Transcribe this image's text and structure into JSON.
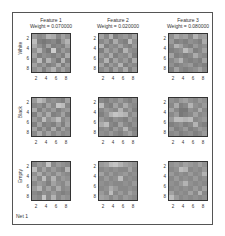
{
  "chart_data": {
    "type": "heatmap",
    "title": "",
    "figure_label": "Net 1",
    "columns": [
      {
        "title": "Feature 1",
        "weight_label": "Weight = 0.070000",
        "weight": 0.07
      },
      {
        "title": "Feature 2",
        "weight_label": "Weight = 0.020000",
        "weight": 0.02
      },
      {
        "title": "Feature 3",
        "weight_label": "Weight = 0.080000",
        "weight": 0.08
      }
    ],
    "rows": [
      "White",
      "Black",
      "Empty"
    ],
    "xticks": [
      "2",
      "4",
      "6",
      "8"
    ],
    "yticks": [
      "2",
      "4",
      "6",
      "8"
    ],
    "grid_size": [
      8,
      8
    ],
    "colormap": "gray",
    "panels": [
      [
        [
          [
            0.55,
            0.45,
            0.5,
            0.7,
            0.65,
            0.45,
            0.6,
            0.5
          ],
          [
            0.75,
            0.4,
            0.35,
            0.4,
            0.45,
            0.35,
            0.55,
            0.7
          ],
          [
            0.65,
            0.5,
            0.4,
            0.6,
            0.4,
            0.45,
            0.4,
            0.6
          ],
          [
            0.5,
            0.7,
            0.45,
            0.35,
            0.85,
            0.4,
            0.55,
            0.45
          ],
          [
            0.6,
            0.4,
            0.5,
            0.45,
            0.4,
            0.5,
            0.4,
            0.65
          ],
          [
            0.45,
            0.75,
            0.4,
            0.7,
            0.5,
            0.35,
            0.7,
            0.4
          ],
          [
            0.6,
            0.45,
            0.55,
            0.4,
            0.45,
            0.65,
            0.4,
            0.55
          ],
          [
            0.5,
            0.6,
            0.4,
            0.55,
            0.7,
            0.45,
            0.6,
            0.45
          ]
        ],
        [
          [
            0.6,
            0.45,
            0.7,
            0.4,
            0.5,
            0.55,
            0.45,
            0.6
          ],
          [
            0.45,
            0.55,
            0.4,
            0.65,
            0.45,
            0.4,
            0.75,
            0.5
          ],
          [
            0.7,
            0.4,
            0.5,
            0.45,
            0.6,
            0.45,
            0.4,
            0.55
          ],
          [
            0.4,
            0.6,
            0.45,
            0.55,
            0.4,
            0.7,
            0.5,
            0.45
          ],
          [
            0.55,
            0.45,
            0.65,
            0.4,
            0.5,
            0.45,
            0.6,
            0.4
          ],
          [
            0.45,
            0.7,
            0.4,
            0.6,
            0.45,
            0.55,
            0.4,
            0.65
          ],
          [
            0.6,
            0.4,
            0.55,
            0.45,
            0.7,
            0.4,
            0.5,
            0.45
          ],
          [
            0.45,
            0.55,
            0.4,
            0.6,
            0.45,
            0.65,
            0.4,
            0.55
          ]
        ],
        [
          [
            0.5,
            0.65,
            0.55,
            0.6,
            0.45,
            0.7,
            0.55,
            0.6
          ],
          [
            0.55,
            0.4,
            0.45,
            0.4,
            0.5,
            0.45,
            0.4,
            0.65
          ],
          [
            0.45,
            0.7,
            0.6,
            0.45,
            0.4,
            0.55,
            0.45,
            0.5
          ],
          [
            0.4,
            0.45,
            0.5,
            0.75,
            0.6,
            0.4,
            0.45,
            0.6
          ],
          [
            0.6,
            0.4,
            0.45,
            0.4,
            0.45,
            0.65,
            0.5,
            0.45
          ],
          [
            0.45,
            0.55,
            0.7,
            0.45,
            0.4,
            0.45,
            0.4,
            0.6
          ],
          [
            0.5,
            0.4,
            0.45,
            0.5,
            0.55,
            0.4,
            0.45,
            0.4
          ],
          [
            0.4,
            0.6,
            0.45,
            0.4,
            0.45,
            0.5,
            0.6,
            0.45
          ]
        ]
      ],
      [
        [
          [
            0.55,
            0.75,
            0.65,
            0.45,
            0.5,
            0.45,
            0.4,
            0.6
          ],
          [
            0.45,
            0.5,
            0.4,
            0.6,
            0.45,
            0.8,
            0.75,
            0.45
          ],
          [
            0.65,
            0.4,
            0.55,
            0.45,
            0.55,
            0.4,
            0.5,
            0.55
          ],
          [
            0.4,
            0.6,
            0.45,
            0.65,
            0.4,
            0.45,
            0.6,
            0.4
          ],
          [
            0.55,
            0.45,
            0.75,
            0.5,
            0.6,
            0.75,
            0.45,
            0.55
          ],
          [
            0.4,
            0.6,
            0.4,
            0.45,
            0.4,
            0.55,
            0.4,
            0.6
          ],
          [
            0.6,
            0.4,
            0.55,
            0.4,
            0.65,
            0.4,
            0.6,
            0.45
          ],
          [
            0.45,
            0.65,
            0.45,
            0.6,
            0.45,
            0.55,
            0.45,
            0.5
          ]
        ],
        [
          [
            0.45,
            0.4,
            0.5,
            0.45,
            0.55,
            0.45,
            0.4,
            0.5
          ],
          [
            0.75,
            0.45,
            0.4,
            0.6,
            0.45,
            0.65,
            0.5,
            0.45
          ],
          [
            0.45,
            0.55,
            0.5,
            0.45,
            0.7,
            0.45,
            0.55,
            0.4
          ],
          [
            0.4,
            0.5,
            0.7,
            0.8,
            0.75,
            0.7,
            0.45,
            0.55
          ],
          [
            0.55,
            0.45,
            0.4,
            0.5,
            0.45,
            0.4,
            0.55,
            0.45
          ],
          [
            0.65,
            0.75,
            0.45,
            0.4,
            0.6,
            0.45,
            0.4,
            0.5
          ],
          [
            0.45,
            0.5,
            0.4,
            0.55,
            0.45,
            0.7,
            0.45,
            0.4
          ],
          [
            0.5,
            0.45,
            0.55,
            0.45,
            0.4,
            0.5,
            0.6,
            0.45
          ]
        ],
        [
          [
            0.5,
            0.45,
            0.55,
            0.6,
            0.5,
            0.45,
            0.55,
            0.5
          ],
          [
            0.45,
            0.65,
            0.4,
            0.45,
            0.7,
            0.5,
            0.45,
            0.55
          ],
          [
            0.6,
            0.45,
            0.35,
            0.35,
            0.5,
            0.45,
            0.65,
            0.45
          ],
          [
            0.45,
            0.55,
            0.35,
            0.4,
            0.45,
            0.6,
            0.45,
            0.5
          ],
          [
            0.55,
            0.75,
            0.75,
            0.7,
            0.75,
            0.45,
            0.5,
            0.55
          ],
          [
            0.4,
            0.45,
            0.5,
            0.4,
            0.45,
            0.7,
            0.45,
            0.4
          ],
          [
            0.55,
            0.4,
            0.45,
            0.55,
            0.4,
            0.45,
            0.55,
            0.5
          ],
          [
            0.45,
            0.5,
            0.4,
            0.45,
            0.5,
            0.4,
            0.45,
            0.55
          ]
        ]
      ],
      [
        [
          [
            0.45,
            0.55,
            0.5,
            0.8,
            0.45,
            0.55,
            0.5,
            0.45
          ],
          [
            0.75,
            0.45,
            0.6,
            0.45,
            0.55,
            0.45,
            0.4,
            0.7
          ],
          [
            0.5,
            0.65,
            0.45,
            0.55,
            0.45,
            0.6,
            0.5,
            0.45
          ],
          [
            0.6,
            0.45,
            0.75,
            0.45,
            0.7,
            0.45,
            0.55,
            0.5
          ],
          [
            0.45,
            0.55,
            0.5,
            0.4,
            0.6,
            0.5,
            0.45,
            0.6
          ],
          [
            0.55,
            0.7,
            0.45,
            0.6,
            0.45,
            0.65,
            0.45,
            0.5
          ],
          [
            0.45,
            0.4,
            0.5,
            0.45,
            0.55,
            0.45,
            0.4,
            0.45
          ],
          [
            0.5,
            0.45,
            0.8,
            0.45,
            0.7,
            0.45,
            0.55,
            0.5
          ]
        ],
        [
          [
            0.55,
            0.6,
            0.75,
            0.8,
            0.7,
            0.6,
            0.55,
            0.5
          ],
          [
            0.45,
            0.5,
            0.45,
            0.5,
            0.45,
            0.45,
            0.6,
            0.45
          ],
          [
            0.6,
            0.45,
            0.55,
            0.45,
            0.5,
            0.55,
            0.45,
            0.5
          ],
          [
            0.45,
            0.55,
            0.45,
            0.5,
            0.75,
            0.45,
            0.5,
            0.45
          ],
          [
            0.5,
            0.45,
            0.5,
            0.45,
            0.45,
            0.5,
            0.45,
            0.55
          ],
          [
            0.45,
            0.5,
            0.65,
            0.55,
            0.45,
            0.45,
            0.5,
            0.45
          ],
          [
            0.55,
            0.45,
            0.75,
            0.45,
            0.55,
            0.45,
            0.6,
            0.5
          ],
          [
            0.6,
            0.55,
            0.45,
            0.55,
            0.45,
            0.55,
            0.5,
            0.45
          ]
        ],
        [
          [
            0.5,
            0.55,
            0.5,
            0.6,
            0.55,
            0.5,
            0.6,
            0.5
          ],
          [
            0.45,
            0.5,
            0.75,
            0.7,
            0.45,
            0.5,
            0.45,
            0.55
          ],
          [
            0.55,
            0.45,
            0.5,
            0.45,
            0.55,
            0.45,
            0.5,
            0.7
          ],
          [
            0.45,
            0.55,
            0.45,
            0.5,
            0.45,
            0.55,
            0.45,
            0.5
          ],
          [
            0.5,
            0.45,
            0.55,
            0.7,
            0.5,
            0.45,
            0.5,
            0.45
          ],
          [
            0.45,
            0.5,
            0.45,
            0.5,
            0.45,
            0.55,
            0.45,
            0.6
          ],
          [
            0.6,
            0.45,
            0.5,
            0.45,
            0.6,
            0.45,
            0.7,
            0.45
          ],
          [
            0.75,
            0.55,
            0.45,
            0.5,
            0.45,
            0.5,
            0.45,
            0.5
          ]
        ]
      ]
    ]
  }
}
